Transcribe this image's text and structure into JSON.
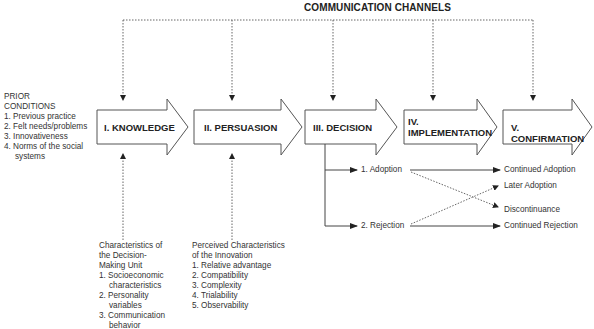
{
  "title": "COMMUNICATION CHANNELS",
  "prior_conditions": {
    "heading_1": "PRIOR",
    "heading_2": "CONDITIONS",
    "items": [
      "1. Previous practice",
      "2. Felt needs/problems",
      "3. Innovativeness",
      "4. Norms of the social",
      "systems"
    ]
  },
  "stages": [
    {
      "label": "I. KNOWLEDGE"
    },
    {
      "label": "II. PERSUASION"
    },
    {
      "label": "III. DECISION"
    },
    {
      "label_line1": "IV.",
      "label_line2": "IMPLEMENTATION"
    },
    {
      "label": "V. CONFIRMATION"
    }
  ],
  "decision_unit": {
    "lines": [
      "Characteristics of",
      "the Decision-",
      "Making Unit",
      "1. Socioeconomic",
      "characteristics",
      "2. Personality",
      "variables",
      "3. Communication",
      "behavior"
    ]
  },
  "innovation": {
    "lines": [
      "Perceived Characteristics",
      "of the Innovation",
      "1. Relative advantage",
      "2. Compatibility",
      "3. Complexity",
      "4. Trialability",
      "5. Observability"
    ]
  },
  "decisions": {
    "adoption": "1. Adoption",
    "rejection": "2. Rejection"
  },
  "outcomes": {
    "continued_adoption": "Continued Adoption",
    "later_adoption": "Later Adoption",
    "discontinuance": "Discontinuance",
    "continued_rejection": "Continued Rejection"
  },
  "colors": {
    "line": "#555555",
    "arrow_fill": "#ffffff",
    "text": "#222222"
  }
}
